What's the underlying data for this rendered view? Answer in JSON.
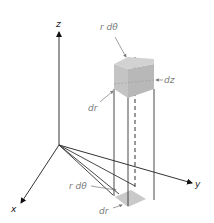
{
  "diagram": {
    "axes": {
      "z_label": "z",
      "x_label": "x",
      "y_label": "y"
    },
    "labels": {
      "top_r_dtheta": "r dθ",
      "dz": "dz",
      "top_dr": "dr",
      "bottom_r_dtheta": "r dθ",
      "bottom_dr": "dr"
    },
    "colors": {
      "axis": "#333333",
      "element_fill": "#c8c8c8",
      "element_dark": "#b0b0b0",
      "label": "#7a7a7a",
      "background": "#ffffff"
    }
  }
}
